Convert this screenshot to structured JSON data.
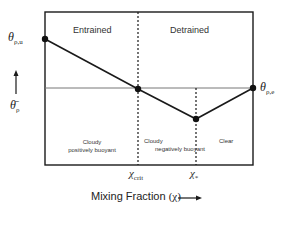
{
  "diagram": {
    "regions": {
      "top_left": "Entrained",
      "top_right": "Detrained",
      "bottom_left_line1": "Cloudy",
      "bottom_left_line2": "positively buoyant",
      "bottom_mid_line1": "Cloudy",
      "bottom_mid_line2": "negatively buoyant",
      "bottom_right": "Clear"
    },
    "points": {
      "theta_u_symbol": "θ",
      "theta_u_sub": "ρ,u",
      "theta_e_symbol": "θ",
      "theta_e_sub": "ρ,e"
    },
    "x_ticks": {
      "crit_symbol": "χ",
      "crit_sub": "crit",
      "star_symbol": "χ",
      "star_sub": "*"
    },
    "y_axis": {
      "label_symbol": "θ̄",
      "label_sub": "ρ"
    },
    "x_axis": {
      "label": "Mixing Fraction",
      "label_symbol": "(χ)"
    },
    "colors": {
      "line": "#1a1a1a",
      "reference_line": "#777777",
      "text": "#222222"
    }
  }
}
